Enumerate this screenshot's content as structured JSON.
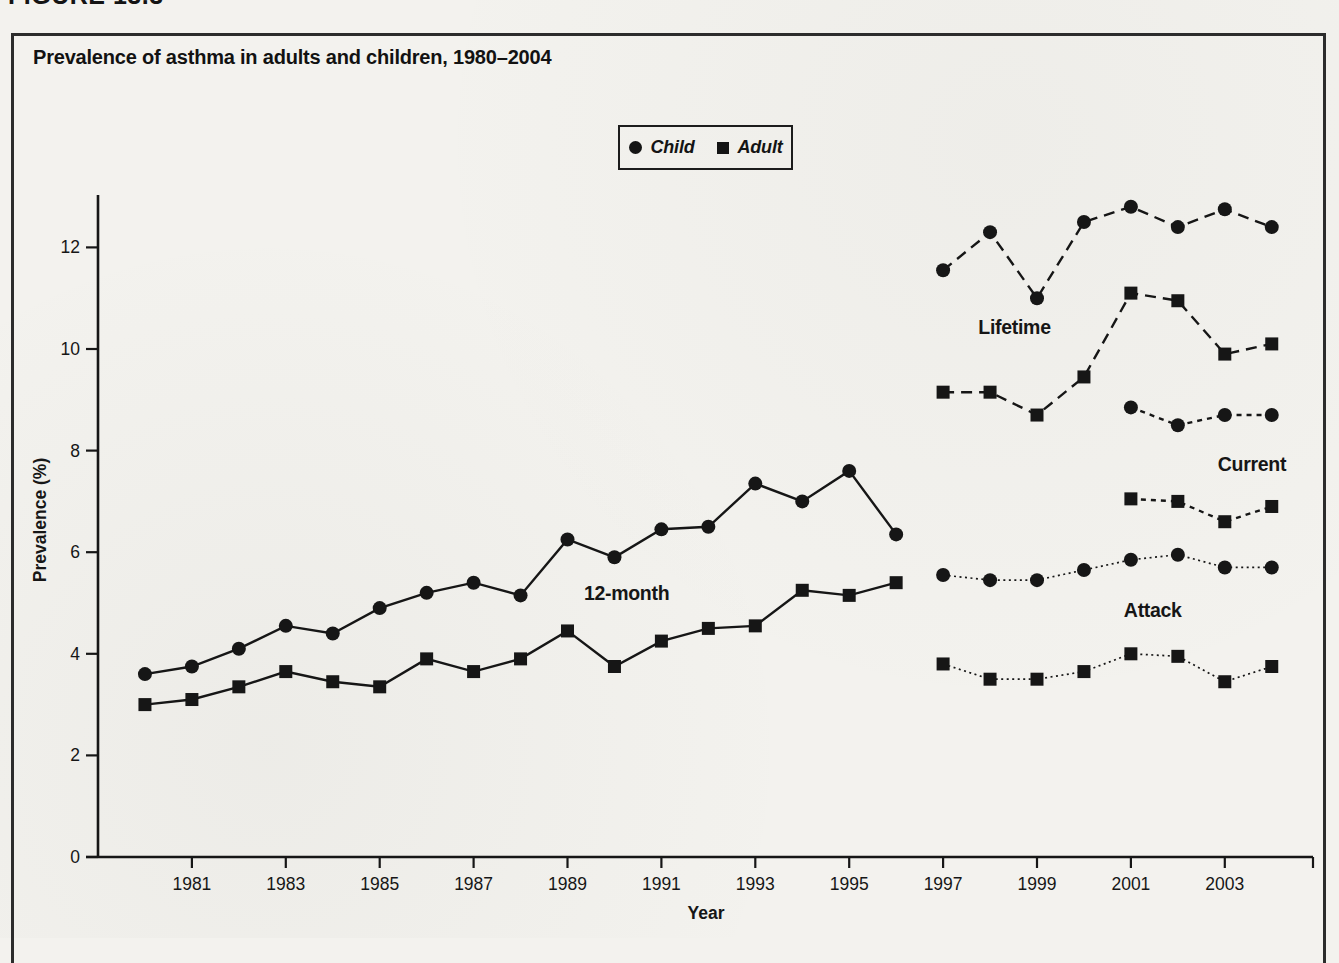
{
  "figure_label": "FIGURE 13.3",
  "title": "Prevalence of asthma in adults and children, 1980–2004",
  "colors": {
    "ink": "#161616",
    "paper": "#f3f2ee",
    "frame": "#2c2c2c"
  },
  "chart_data": {
    "type": "line",
    "title": "Prevalence of asthma in adults and children, 1980–2004",
    "xlabel": "Year",
    "ylabel": "Prevalence (%)",
    "xlim": [
      1979,
      2005
    ],
    "ylim": [
      0,
      13.5
    ],
    "yticks": [
      0,
      2,
      4,
      6,
      8,
      10,
      12
    ],
    "xticks": [
      1981,
      1983,
      1985,
      1987,
      1989,
      1991,
      1993,
      1995,
      1997,
      1999,
      2001,
      2003
    ],
    "grid": false,
    "legend": {
      "position": "top-center",
      "entries": [
        {
          "label": "Child",
          "marker": "circle"
        },
        {
          "label": "Adult",
          "marker": "square"
        }
      ]
    },
    "series": [
      {
        "name": "12-month Child",
        "measure": "12-month",
        "population": "Child",
        "marker": "circle",
        "linestyle": "solid",
        "x": [
          1980,
          1981,
          1982,
          1983,
          1984,
          1985,
          1986,
          1987,
          1988,
          1989,
          1990,
          1991,
          1992,
          1993,
          1994,
          1995,
          1996
        ],
        "y": [
          3.6,
          3.75,
          4.1,
          4.55,
          4.4,
          4.9,
          5.2,
          5.4,
          5.15,
          6.25,
          5.9,
          6.45,
          6.5,
          7.35,
          7.0,
          7.6,
          6.35
        ]
      },
      {
        "name": "12-month Adult",
        "measure": "12-month",
        "population": "Adult",
        "marker": "square",
        "linestyle": "solid",
        "x": [
          1980,
          1981,
          1982,
          1983,
          1984,
          1985,
          1986,
          1987,
          1988,
          1989,
          1990,
          1991,
          1992,
          1993,
          1994,
          1995,
          1996
        ],
        "y": [
          3.0,
          3.1,
          3.35,
          3.65,
          3.45,
          3.35,
          3.9,
          3.65,
          3.9,
          4.45,
          3.75,
          4.25,
          4.5,
          4.55,
          5.25,
          5.15,
          5.4
        ]
      },
      {
        "name": "Lifetime Child",
        "measure": "Lifetime",
        "population": "Child",
        "marker": "circle",
        "linestyle": "dashed",
        "x": [
          1997,
          1998,
          1999,
          2000,
          2001,
          2002,
          2003,
          2004
        ],
        "y": [
          11.55,
          12.3,
          11.0,
          12.5,
          12.8,
          12.4,
          12.75,
          12.4
        ]
      },
      {
        "name": "Lifetime Adult",
        "measure": "Lifetime",
        "population": "Adult",
        "marker": "square",
        "linestyle": "dashed",
        "x": [
          1997,
          1998,
          1999,
          2000,
          2001,
          2002,
          2003,
          2004
        ],
        "y": [
          9.15,
          9.15,
          8.7,
          9.45,
          11.1,
          10.95,
          9.9,
          10.1
        ]
      },
      {
        "name": "Current Child",
        "measure": "Current",
        "population": "Child",
        "marker": "circle",
        "linestyle": "dashed-short",
        "x": [
          2001,
          2002,
          2003,
          2004
        ],
        "y": [
          8.85,
          8.5,
          8.7,
          8.7
        ]
      },
      {
        "name": "Current Adult",
        "measure": "Current",
        "population": "Adult",
        "marker": "square",
        "linestyle": "dashed-short",
        "x": [
          2001,
          2002,
          2003,
          2004
        ],
        "y": [
          7.05,
          7.0,
          6.6,
          6.9
        ]
      },
      {
        "name": "Attack Child",
        "measure": "Attack",
        "population": "Child",
        "marker": "circle",
        "linestyle": "dotted",
        "x": [
          1997,
          1998,
          1999,
          2000,
          2001,
          2002,
          2003,
          2004
        ],
        "y": [
          5.55,
          5.45,
          5.45,
          5.65,
          5.85,
          5.95,
          5.7,
          5.7
        ]
      },
      {
        "name": "Attack Adult",
        "measure": "Attack",
        "population": "Adult",
        "marker": "square",
        "linestyle": "dotted",
        "x": [
          1997,
          1998,
          1999,
          2000,
          2001,
          2002,
          2003,
          2004
        ],
        "y": [
          3.8,
          3.5,
          3.5,
          3.65,
          4.0,
          3.95,
          3.45,
          3.75
        ]
      }
    ],
    "annotations": [
      {
        "text": "12-month",
        "x": 1989.35,
        "y": 5.05
      },
      {
        "text": "Lifetime",
        "x": 1997.75,
        "y": 10.3
      },
      {
        "text": "Current",
        "x": 2002.85,
        "y": 7.6
      },
      {
        "text": "Attack",
        "x": 2000.85,
        "y": 4.72
      }
    ]
  }
}
